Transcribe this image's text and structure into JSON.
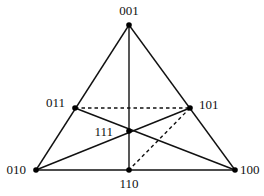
{
  "diagram": {
    "nodes": [
      {
        "id": "001",
        "label": "001",
        "x": 129,
        "y": 25,
        "lx": 129,
        "ly": 15,
        "anchor": "middle"
      },
      {
        "id": "010",
        "label": "010",
        "x": 36,
        "y": 170,
        "lx": 26,
        "ly": 174,
        "anchor": "end"
      },
      {
        "id": "100",
        "label": "100",
        "x": 235,
        "y": 170,
        "lx": 240,
        "ly": 174,
        "anchor": "start"
      },
      {
        "id": "011",
        "label": "011",
        "x": 75,
        "y": 108,
        "lx": 65,
        "ly": 107,
        "anchor": "end"
      },
      {
        "id": "101",
        "label": "101",
        "x": 190,
        "y": 108,
        "lx": 199,
        "ly": 109,
        "anchor": "start"
      },
      {
        "id": "110",
        "label": "110",
        "x": 129,
        "y": 170,
        "lx": 129,
        "ly": 188,
        "anchor": "middle"
      },
      {
        "id": "111",
        "label": "111",
        "x": 129,
        "y": 131,
        "lx": 113,
        "ly": 136,
        "anchor": "end"
      }
    ],
    "edges": [
      {
        "from": "001",
        "to": "010",
        "style": "solid"
      },
      {
        "from": "001",
        "to": "100",
        "style": "solid"
      },
      {
        "from": "010",
        "to": "100",
        "style": "solid"
      },
      {
        "from": "001",
        "to": "110",
        "style": "solid"
      },
      {
        "from": "011",
        "to": "100",
        "style": "solid"
      },
      {
        "from": "010",
        "to": "101",
        "style": "solid"
      },
      {
        "from": "011",
        "to": "101",
        "style": "dashed"
      },
      {
        "from": "101",
        "to": "110",
        "style": "dashed"
      }
    ],
    "colors": {
      "line": "#111111",
      "node": "#000000",
      "background": "#ffffff"
    }
  }
}
